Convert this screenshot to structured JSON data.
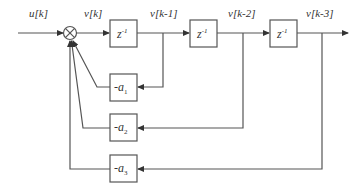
{
  "diagram": {
    "type": "block-diagram",
    "signals": {
      "input": "u[k]",
      "sum_output": "v[k]",
      "delay1_output": "v[k-1]",
      "delay2_output": "v[k-2]",
      "delay3_output": "v[k-3]"
    },
    "delays": [
      {
        "label": "z",
        "exp": "-1"
      },
      {
        "label": "z",
        "exp": "-1"
      },
      {
        "label": "z",
        "exp": "-1"
      }
    ],
    "gains": [
      {
        "prefix": "-a",
        "sub": "1"
      },
      {
        "prefix": "-a",
        "sub": "2"
      },
      {
        "prefix": "-a",
        "sub": "3"
      }
    ],
    "summing_junction": {
      "symbol": "⊗"
    },
    "colors": {
      "line": "#555555",
      "text": "#333333",
      "background": "#ffffff"
    }
  }
}
